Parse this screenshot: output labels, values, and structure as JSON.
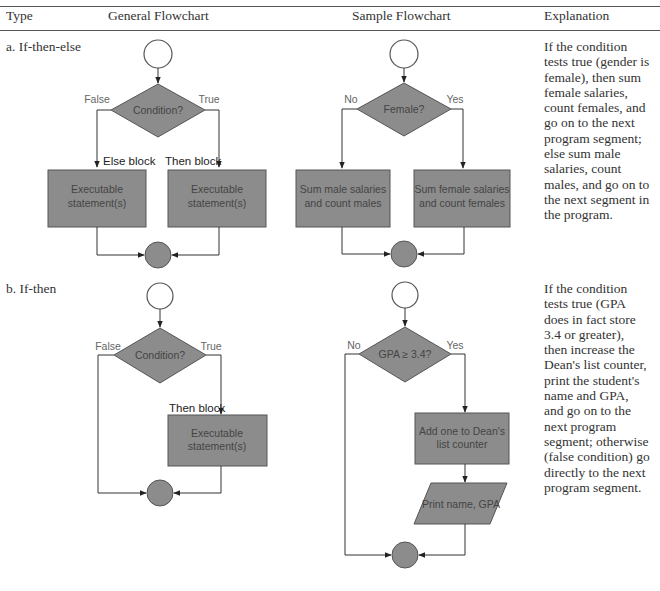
{
  "headers": {
    "type": "Type",
    "general": "General Flowchart",
    "sample": "Sample Flowchart",
    "explanation": "Explanation"
  },
  "colors": {
    "shape_fill": "#8c8c8c",
    "shape_stroke": "#555555",
    "line": "#444444",
    "text": "#333333"
  },
  "rows": [
    {
      "type_label": "a. If-then-else",
      "general": {
        "condition": "Condition?",
        "false_label": "False",
        "true_label": "True",
        "else_block_label": "Else block",
        "then_block_label": "Then block",
        "else_box": [
          "Executable",
          "statement(s)"
        ],
        "then_box": [
          "Executable",
          "statement(s)"
        ]
      },
      "sample": {
        "condition": "Female?",
        "false_label": "No",
        "true_label": "Yes",
        "else_box": [
          "Sum male salaries",
          "and count males"
        ],
        "then_box": [
          "Sum female salaries",
          "and count females"
        ]
      },
      "explanation_lines": [
        "If the condition",
        "tests true (gender is",
        "female), then sum",
        "female salaries,",
        "count females, and",
        "go on to the next",
        "program segment;",
        "else sum male",
        "salaries, count",
        "males, and go on to",
        "the next segment in",
        "the program."
      ]
    },
    {
      "type_label": "b. If-then",
      "general": {
        "condition": "Condition?",
        "false_label": "False",
        "true_label": "True",
        "then_block_label": "Then block",
        "then_box": [
          "Executable",
          "statement(s)"
        ]
      },
      "sample": {
        "condition": "GPA ≥ 3.4?",
        "false_label": "No",
        "true_label": "Yes",
        "then_box": [
          "Add one to Dean's",
          "list counter"
        ],
        "io_box": "Print name, GPA"
      },
      "explanation_lines": [
        "If the condition",
        "tests true (GPA",
        "does in fact store",
        "3.4 or greater),",
        "then increase the",
        "Dean's list counter,",
        "print the student's",
        "name and GPA,",
        "and go on to the",
        "next program",
        "segment; otherwise",
        "(false condition) go",
        "directly to the next",
        "program segment."
      ]
    }
  ]
}
